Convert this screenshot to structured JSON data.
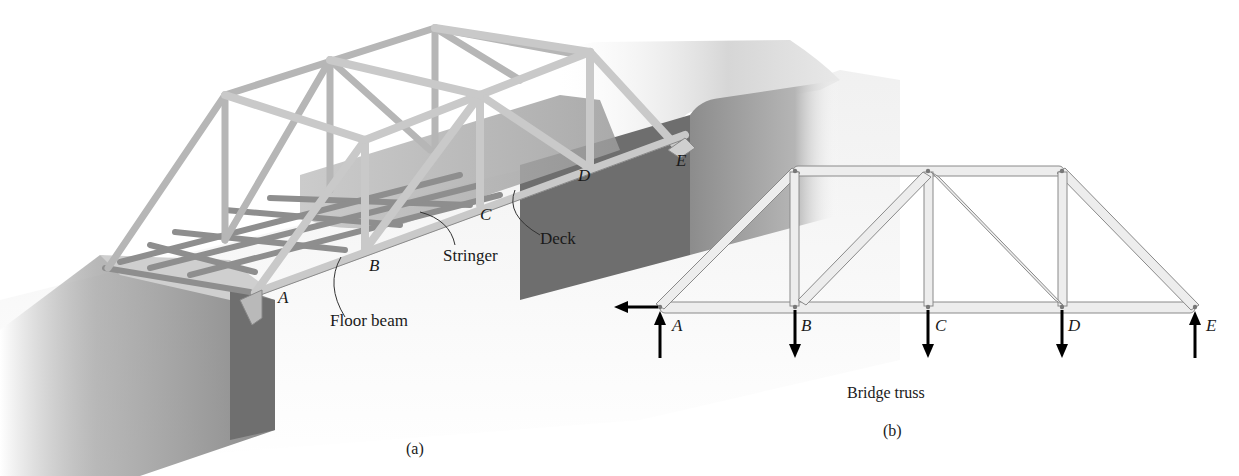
{
  "panel_a": {
    "caption": "(a)",
    "joint_labels": {
      "A": "A",
      "B": "B",
      "C": "C",
      "D": "D",
      "E": "E"
    },
    "callouts": {
      "floor_beam": "Floor beam",
      "stringer": "Stringer",
      "deck": "Deck"
    }
  },
  "panel_b": {
    "title": "Bridge truss",
    "caption": "(b)",
    "joint_labels": {
      "A": "A",
      "B": "B",
      "C": "C",
      "D": "D",
      "E": "E"
    },
    "loads": {
      "A": "reaction up + horizontal reaction left",
      "B": "load down",
      "C": "load down",
      "D": "load down",
      "E": "reaction up"
    }
  },
  "colors": {
    "member_fill": "#ececec",
    "member_stroke": "#8a8a8a",
    "abutment_dark": "#7a7a7a",
    "abutment_light": "#c8c8c8",
    "arrow": "#000000",
    "text": "#1a1a1a"
  }
}
